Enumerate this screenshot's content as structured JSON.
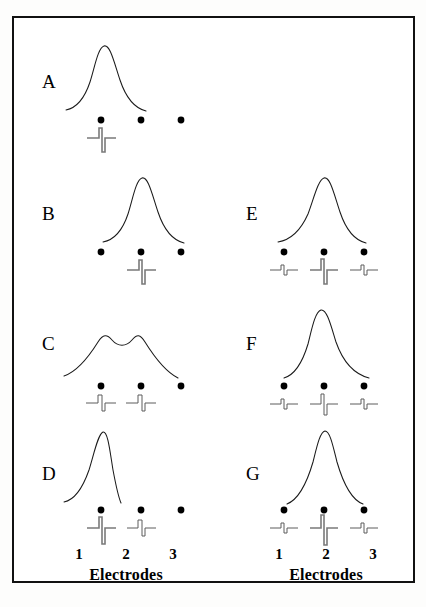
{
  "figure": {
    "title": "",
    "border_color": "#111111",
    "background": "#ffffff",
    "curve_color": "#1a1a1a",
    "dot_color": "#000000",
    "trace_color": "#5d5d5d"
  },
  "axes": [
    {
      "id": "left-axis",
      "electrode_numbers": [
        "1",
        "2",
        "3"
      ],
      "title": "Electrodes"
    },
    {
      "id": "right-axis",
      "electrode_numbers": [
        "1",
        "2",
        "3"
      ],
      "title": "Electrodes"
    }
  ],
  "panels": [
    {
      "id": "A",
      "label": "A",
      "column": "left",
      "description": "Broad potential peak centered over electrode 1",
      "curve": {
        "shape": "single-peak",
        "peak_electrode": 1,
        "peak_offset": 0,
        "width": "broad",
        "amplitude": 1.0
      },
      "electrodes": [
        {
          "number": "1",
          "spike": "large-downward"
        },
        {
          "number": "2",
          "spike": "none"
        },
        {
          "number": "3",
          "spike": "none"
        }
      ]
    },
    {
      "id": "B",
      "label": "B",
      "column": "left",
      "description": "Broad potential peak centered over electrode 2",
      "curve": {
        "shape": "single-peak",
        "peak_electrode": 2,
        "peak_offset": 0,
        "width": "broad",
        "amplitude": 1.0
      },
      "electrodes": [
        {
          "number": "1",
          "spike": "none"
        },
        {
          "number": "2",
          "spike": "large-downward"
        },
        {
          "number": "3",
          "spike": "none"
        }
      ]
    },
    {
      "id": "C",
      "label": "C",
      "column": "left",
      "description": "Broad flattened double-humped potential spanning electrodes 1 and 2",
      "curve": {
        "shape": "double-hump",
        "peak_electrode": 1.5,
        "peak_offset": 0,
        "width": "very-broad",
        "amplitude": 0.62
      },
      "electrodes": [
        {
          "number": "1",
          "spike": "medium-downward"
        },
        {
          "number": "2",
          "spike": "medium-downward"
        },
        {
          "number": "3",
          "spike": "none"
        }
      ]
    },
    {
      "id": "D",
      "label": "D",
      "column": "left",
      "description": "Narrow potential peak over electrode 1 with secondary small spike at electrode 2",
      "curve": {
        "shape": "single-peak",
        "peak_electrode": 1,
        "peak_offset": 0,
        "width": "narrow",
        "amplitude": 1.05
      },
      "electrodes": [
        {
          "number": "1",
          "spike": "large-downward"
        },
        {
          "number": "2",
          "spike": "small-downward"
        },
        {
          "number": "3",
          "spike": "none"
        }
      ]
    },
    {
      "id": "E",
      "label": "E",
      "column": "right",
      "description": "Broad potential peak over electrode 2 with small biphasic blips at electrodes 1 and 3",
      "curve": {
        "shape": "single-peak",
        "peak_electrode": 2,
        "peak_offset": 0,
        "width": "broad",
        "amplitude": 1.0
      },
      "electrodes": [
        {
          "number": "1",
          "spike": "tiny-biphasic"
        },
        {
          "number": "2",
          "spike": "large-downward"
        },
        {
          "number": "3",
          "spike": "tiny-biphasic"
        }
      ]
    },
    {
      "id": "F",
      "label": "F",
      "column": "right",
      "description": "Asymmetric potential peak left of electrode 2 with small biphasic blips at electrodes 1 and 3",
      "curve": {
        "shape": "single-peak-skewed",
        "peak_electrode": 2,
        "peak_offset": -6,
        "width": "broad",
        "amplitude": 1.0
      },
      "electrodes": [
        {
          "number": "1",
          "spike": "tiny-biphasic"
        },
        {
          "number": "2",
          "spike": "medium-downward"
        },
        {
          "number": "3",
          "spike": "tiny-biphasic"
        }
      ]
    },
    {
      "id": "G",
      "label": "G",
      "column": "right",
      "description": "Narrow tall potential peak over electrode 2 with small biphasic blips at electrodes 1 and 3",
      "curve": {
        "shape": "single-peak",
        "peak_electrode": 2,
        "peak_offset": 0,
        "width": "narrow",
        "amplitude": 1.1
      },
      "electrodes": [
        {
          "number": "1",
          "spike": "tiny-biphasic"
        },
        {
          "number": "2",
          "spike": "very-large-downward"
        },
        {
          "number": "3",
          "spike": "tiny-biphasic"
        }
      ]
    }
  ]
}
